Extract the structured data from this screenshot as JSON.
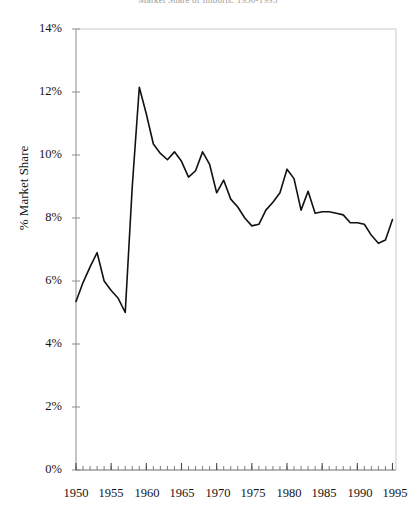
{
  "chart_data": {
    "type": "line",
    "title": "Market Share of Imports, 1950-1995",
    "xlabel": "",
    "ylabel": "% Market Share",
    "xlim": [
      1950,
      1995.5
    ],
    "ylim": [
      0,
      14
    ],
    "grid": false,
    "legend": "none",
    "y_ticks": [
      "0%",
      "2%",
      "4%",
      "6%",
      "8%",
      "10%",
      "12%",
      "14%"
    ],
    "y_tick_values": [
      0,
      2,
      4,
      6,
      8,
      10,
      12,
      14
    ],
    "x_ticks": [
      "1950",
      "1955",
      "1960",
      "1965",
      "1970",
      "1975",
      "1980",
      "1985",
      "1990",
      "1995"
    ],
    "x_tick_values": [
      1950,
      1955,
      1960,
      1965,
      1970,
      1975,
      1980,
      1985,
      1990,
      1995
    ],
    "x_minor_tick_interval": 1,
    "line_color": "#111111",
    "axis_color": "#8c8c8c",
    "series": [
      {
        "name": "% Market Share",
        "x": [
          1950,
          1951,
          1952,
          1953,
          1954,
          1955,
          1956,
          1957,
          1958,
          1959,
          1960,
          1961,
          1962,
          1963,
          1964,
          1965,
          1966,
          1967,
          1968,
          1969,
          1970,
          1971,
          1972,
          1973,
          1974,
          1975,
          1976,
          1977,
          1978,
          1979,
          1980,
          1981,
          1982,
          1983,
          1984,
          1985,
          1986,
          1987,
          1988,
          1989,
          1990,
          1991,
          1992,
          1993,
          1994,
          1995
        ],
        "values": [
          5.35,
          5.95,
          6.45,
          6.9,
          6.0,
          5.7,
          5.45,
          5.0,
          9.0,
          12.15,
          11.3,
          10.35,
          10.05,
          9.85,
          10.1,
          9.8,
          9.3,
          9.5,
          10.1,
          9.7,
          8.8,
          9.2,
          8.6,
          8.35,
          8.0,
          7.75,
          7.8,
          8.25,
          8.5,
          8.8,
          9.55,
          9.25,
          8.25,
          8.85,
          8.15,
          8.2,
          8.2,
          8.15,
          8.1,
          7.85,
          7.85,
          7.8,
          7.45,
          7.2,
          7.3,
          7.95
        ]
      }
    ]
  }
}
